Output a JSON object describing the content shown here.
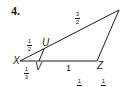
{
  "problem_number": "4.",
  "vertices": {
    "X": "X",
    "U": "U",
    "V": "V",
    "Z": "Z"
  },
  "segment_labels": {
    "top_side": {
      "num": "3",
      "den": "2"
    },
    "XU": {
      "num": "1",
      "den": "2"
    },
    "XV": {
      "num": "1",
      "den": "3"
    },
    "VZ": "1"
  },
  "answer_choices_partial": [
    {
      "num": "1",
      "den": ""
    },
    {
      "num": "1",
      "den": ""
    }
  ],
  "colors": {
    "ink": "#1a1a1a",
    "background": "#ffffff"
  }
}
